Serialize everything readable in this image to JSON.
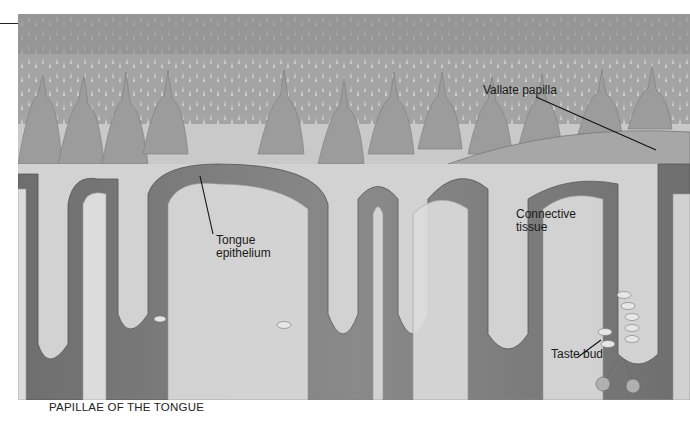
{
  "figure": {
    "caption": "PAPILLAE OF THE TONGUE",
    "labels": {
      "vallate_papilla": "Vallate papilla",
      "tongue_epithelium_line1": "Tongue",
      "tongue_epithelium_line2": "epithelium",
      "connective_tissue_line1": "Connective",
      "connective_tissue_line2": "tissue",
      "taste_bud": "Taste bud"
    }
  }
}
